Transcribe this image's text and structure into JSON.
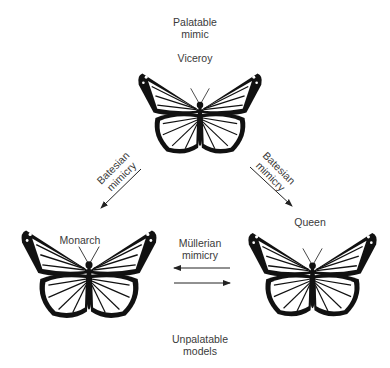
{
  "title_top": {
    "line1": "Palatable",
    "line2": "mimic"
  },
  "title_bottom": {
    "line1": "Unpalatable",
    "line2": "models"
  },
  "butterflies": {
    "viceroy": {
      "label": "Viceroy",
      "role": "palatable mimic"
    },
    "monarch": {
      "label": "Monarch",
      "role": "unpalatable model"
    },
    "queen": {
      "label": "Queen",
      "role": "unpalatable model"
    }
  },
  "relations": {
    "left": {
      "line1": "Batesian",
      "line2": "mimicry",
      "from": "Viceroy",
      "to": "Monarch"
    },
    "right": {
      "line1": "Batesian",
      "line2": "mimicry",
      "from": "Viceroy",
      "to": "Queen"
    },
    "bottom": {
      "line1": "Müllerian",
      "line2": "mimicry",
      "between": [
        "Monarch",
        "Queen"
      ]
    }
  },
  "colors": {
    "ink": "#111111",
    "text": "#3a3a3a",
    "background": "#ffffff"
  }
}
